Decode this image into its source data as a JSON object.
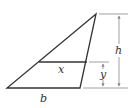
{
  "diagram": {
    "type": "triangle-with-cross-section",
    "colors": {
      "stroke": "#333333",
      "dimension_line": "#888888",
      "background": "#ffffff"
    },
    "labels": {
      "height": "h",
      "cross_section": "x",
      "offset": "y",
      "base": "b"
    }
  }
}
